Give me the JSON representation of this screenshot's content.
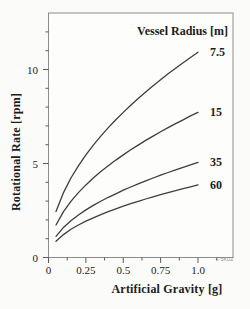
{
  "page": {
    "background": "#fbfbf9"
  },
  "watermark": "© 5KUZ",
  "colors": {
    "plot_bg": "#fdfdfc",
    "frame": "#8c8c8c",
    "tick": "#5a5a5a",
    "curve": "#3d3d3d",
    "text": "#1c1c1c",
    "watermark": "#8a8a8a"
  },
  "chart_data": {
    "type": "line",
    "title": "",
    "legend_title": "Vessel Radius [m]",
    "xlabel": "Artificial Gravity [g]",
    "ylabel": "Rotational Rate [rpm]",
    "xlim": [
      0,
      1.24
    ],
    "ylim": [
      0,
      13
    ],
    "grid": false,
    "legend_position": "curve-end-right",
    "x": [
      0.05,
      0.1,
      0.15,
      0.2,
      0.25,
      0.3,
      0.35,
      0.4,
      0.45,
      0.5,
      0.55,
      0.6,
      0.65,
      0.7,
      0.75,
      0.8,
      0.85,
      0.9,
      0.95,
      1.0
    ],
    "series": [
      {
        "name": "radius-7.5m",
        "label": "7.5",
        "radius_m": 7.5,
        "values": [
          2.44,
          3.45,
          4.23,
          4.88,
          5.46,
          5.98,
          6.46,
          6.91,
          7.33,
          7.72,
          8.1,
          8.46,
          8.8,
          9.14,
          9.46,
          9.77,
          10.07,
          10.36,
          10.64,
          10.92
        ]
      },
      {
        "name": "radius-15m",
        "label": "15",
        "radius_m": 15,
        "values": [
          1.73,
          2.44,
          2.99,
          3.45,
          3.86,
          4.23,
          4.57,
          4.88,
          5.18,
          5.46,
          5.73,
          5.98,
          6.23,
          6.46,
          6.69,
          6.91,
          7.12,
          7.32,
          7.53,
          7.72
        ]
      },
      {
        "name": "radius-35m",
        "label": "35",
        "radius_m": 35,
        "values": [
          1.13,
          1.6,
          1.96,
          2.26,
          2.53,
          2.77,
          2.99,
          3.2,
          3.39,
          3.58,
          3.75,
          3.92,
          4.08,
          4.23,
          4.38,
          4.52,
          4.66,
          4.8,
          4.93,
          5.06
        ]
      },
      {
        "name": "radius-60m",
        "label": "60",
        "radius_m": 60,
        "values": [
          0.86,
          1.22,
          1.5,
          1.73,
          1.93,
          2.11,
          2.28,
          2.44,
          2.59,
          2.73,
          2.86,
          2.99,
          3.11,
          3.23,
          3.34,
          3.45,
          3.56,
          3.66,
          3.76,
          3.86
        ]
      }
    ],
    "x_axis": {
      "major_ticks": [
        0,
        0.25,
        0.5,
        0.75,
        1.0
      ],
      "major_tick_labels": [
        "0",
        "0.25",
        "0.5",
        "0.75",
        "1.0"
      ],
      "minor_ticks": [
        0.125,
        0.375,
        0.625,
        0.875,
        1.125
      ]
    },
    "y_axis": {
      "major_ticks": [
        0,
        5,
        10
      ],
      "major_tick_labels": [
        "0",
        "5",
        "10"
      ],
      "minor_ticks": [
        1,
        2,
        3,
        4,
        6,
        7,
        8,
        9,
        11,
        12
      ]
    }
  }
}
